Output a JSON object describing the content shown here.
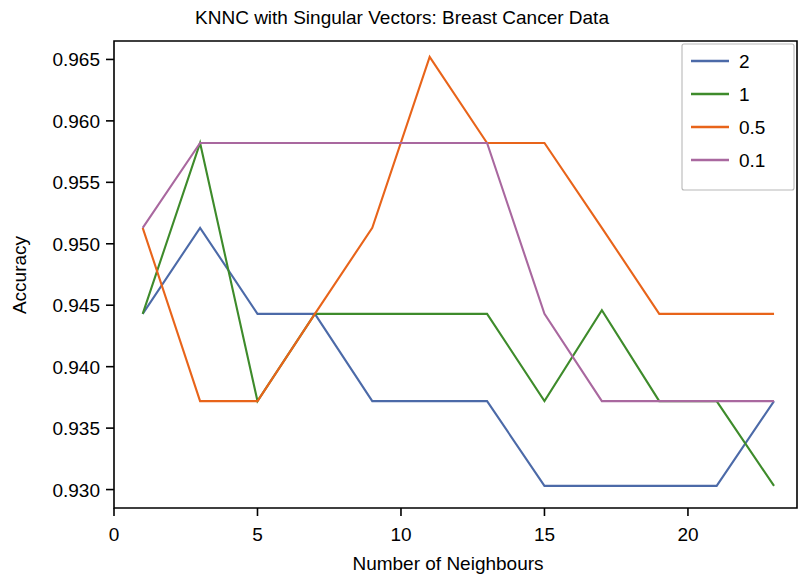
{
  "chart_data": {
    "type": "line",
    "title": "KNNC with Singular Vectors: Breast Cancer Data",
    "xlabel": "Number of Neighbours",
    "ylabel": "Accuracy",
    "xlim": [
      0,
      23.8
    ],
    "ylim": [
      0.9285,
      0.9665
    ],
    "grid": false,
    "legend_position": "upper right",
    "legend_title": "",
    "xticks": [
      0,
      5,
      10,
      15,
      20
    ],
    "xtick_labels": [
      "0",
      "5",
      "10",
      "15",
      "20"
    ],
    "yticks": [
      0.93,
      0.935,
      0.94,
      0.945,
      0.95,
      0.955,
      0.96,
      0.965
    ],
    "ytick_labels": [
      "0.930",
      "0.935",
      "0.940",
      "0.945",
      "0.950",
      "0.955",
      "0.960",
      "0.965"
    ],
    "x": [
      1,
      3,
      5,
      7,
      9,
      11,
      13,
      15,
      17,
      19,
      21,
      23
    ],
    "series": [
      {
        "name": "2",
        "color": "#4c6aa8",
        "values": [
          0.9443,
          0.9513,
          0.9443,
          0.9443,
          0.9372,
          0.9372,
          0.9372,
          0.9303,
          0.9303,
          0.9303,
          0.9303,
          0.9372
        ]
      },
      {
        "name": "1",
        "color": "#3e8b2b",
        "values": [
          0.9443,
          0.9582,
          0.9372,
          0.9443,
          0.9443,
          0.9443,
          0.9443,
          0.9372,
          0.9446,
          0.9372,
          0.9372,
          0.9303
        ]
      },
      {
        "name": "0.5",
        "color": "#e8641a",
        "values": [
          0.9513,
          0.9372,
          0.9372,
          0.9443,
          0.9513,
          0.9652,
          0.9582,
          0.9582,
          0.9513,
          0.9443,
          0.9443,
          0.9443
        ]
      },
      {
        "name": "0.1",
        "color": "#a9689f",
        "values": [
          0.9513,
          0.9582,
          0.9582,
          0.9582,
          0.9582,
          0.9582,
          0.9582,
          0.9443,
          0.9372,
          0.9372,
          0.9372,
          0.9372
        ]
      }
    ]
  },
  "legend": {
    "entries": [
      {
        "label": "2"
      },
      {
        "label": "1"
      },
      {
        "label": "0.5"
      },
      {
        "label": "0.1"
      }
    ]
  }
}
